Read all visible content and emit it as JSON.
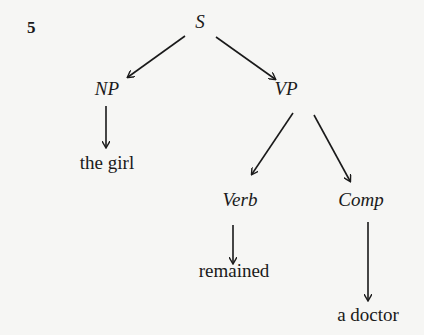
{
  "figure": {
    "number": "5",
    "type": "syntax tree",
    "nodes": [
      {
        "id": "S",
        "label": "S",
        "kind": "category",
        "x": 200,
        "y": 22
      },
      {
        "id": "NP",
        "label": "NP",
        "kind": "category",
        "x": 107,
        "y": 89
      },
      {
        "id": "VP",
        "label": "VP",
        "kind": "category",
        "x": 286,
        "y": 89
      },
      {
        "id": "the_girl",
        "label": "the girl",
        "kind": "word",
        "x": 107,
        "y": 163
      },
      {
        "id": "Verb",
        "label": "Verb",
        "kind": "category",
        "x": 240,
        "y": 200
      },
      {
        "id": "Comp",
        "label": "Comp",
        "kind": "category",
        "x": 361,
        "y": 200
      },
      {
        "id": "remained",
        "label": "remained",
        "kind": "word",
        "x": 234,
        "y": 271
      },
      {
        "id": "a_doctor",
        "label": "a doctor",
        "kind": "word",
        "x": 368,
        "y": 315
      }
    ],
    "edges": [
      {
        "from": "S",
        "to": "NP",
        "x1": 185,
        "y1": 36,
        "x2": 128,
        "y2": 77
      },
      {
        "from": "S",
        "to": "VP",
        "x1": 216,
        "y1": 37,
        "x2": 275,
        "y2": 79
      },
      {
        "from": "NP",
        "to": "the_girl",
        "x1": 106,
        "y1": 106,
        "x2": 106,
        "y2": 147
      },
      {
        "from": "VP",
        "to": "Verb",
        "x1": 293,
        "y1": 113,
        "x2": 252,
        "y2": 174
      },
      {
        "from": "VP",
        "to": "Comp",
        "x1": 314,
        "y1": 115,
        "x2": 350,
        "y2": 181
      },
      {
        "from": "Verb",
        "to": "remained",
        "x1": 233,
        "y1": 225,
        "x2": 233,
        "y2": 263
      },
      {
        "from": "Comp",
        "to": "a_doctor",
        "x1": 368,
        "y1": 222,
        "x2": 368,
        "y2": 300
      }
    ]
  }
}
